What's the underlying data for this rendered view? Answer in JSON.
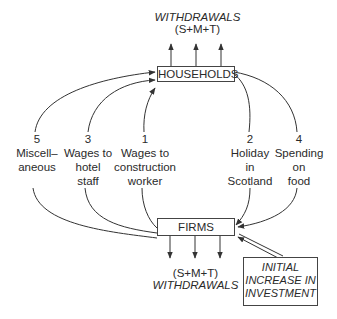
{
  "diagram": {
    "top_withdrawals": {
      "title": "WITHDRAWALS",
      "formula": "(S+M+T)"
    },
    "households": {
      "label": "HOUSEHOLDS"
    },
    "firms": {
      "label": "FIRMS"
    },
    "bottom_withdrawals": {
      "formula": "(S+M+T)",
      "title": "WITHDRAWALS"
    },
    "investment_box": {
      "line1": "INITIAL",
      "line2": "INCREASE IN",
      "line3": "INVESTMENT"
    },
    "flows": [
      {
        "number": "5",
        "line1": "Miscell–",
        "line2": "aneous",
        "line3": ""
      },
      {
        "number": "3",
        "line1": "Wages to",
        "line2": "hotel",
        "line3": "staff"
      },
      {
        "number": "1",
        "line1": "Wages to",
        "line2": "construction",
        "line3": "worker"
      },
      {
        "number": "2",
        "line1": "Holiday",
        "line2": "in",
        "line3": "Scotland"
      },
      {
        "number": "4",
        "line1": "Spending",
        "line2": "on",
        "line3": "food"
      }
    ],
    "colors": {
      "line": "#333333",
      "text": "#2a2a2a",
      "background": "#ffffff"
    }
  }
}
